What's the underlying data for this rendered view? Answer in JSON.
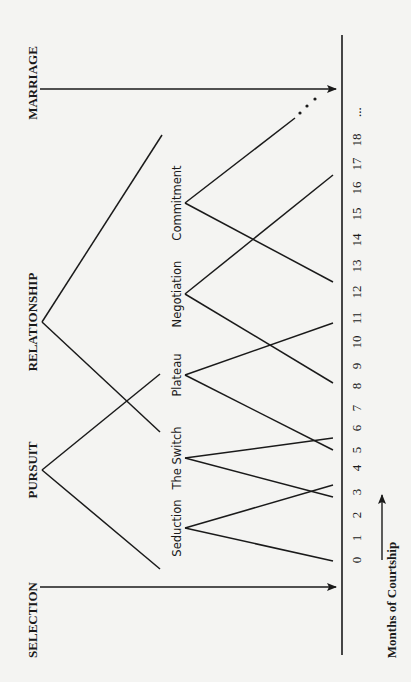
{
  "diagram": {
    "orientation": "rotated-90-ccw",
    "colors": {
      "background": "#f4f4f2",
      "ink": "#1a1a1a"
    },
    "axis": {
      "label": "Months of Courtship",
      "x": 342,
      "y_top": 35,
      "y_bottom": 655,
      "ticks": [
        "0",
        "1",
        "2",
        "3",
        "4",
        "5",
        "6",
        "7",
        "8",
        "9",
        "10",
        "11",
        "12",
        "13",
        "14",
        "15",
        "16",
        "17",
        "18",
        "..."
      ],
      "tick_y": [
        560,
        538,
        515,
        492,
        468,
        450,
        428,
        408,
        386,
        366,
        342,
        318,
        292,
        266,
        240,
        214,
        188,
        164,
        140,
        112
      ],
      "tick_label_x": 358,
      "arrow": {
        "x": 382,
        "y_from": 560,
        "y_to": 495
      },
      "label_x": 393,
      "label_y": 600
    },
    "phases": [
      {
        "id": "selection",
        "label": "SELECTION",
        "label_x": 34,
        "label_y": 620,
        "arrow": {
          "y": 587,
          "x_from": 40,
          "x_to": 336
        }
      },
      {
        "id": "pursuit",
        "label": "PURSUIT",
        "label_x": 34,
        "label_y": 470,
        "apex": [
          42,
          470
        ],
        "ends": [
          [
            160,
            569
          ],
          [
            160,
            374
          ]
        ]
      },
      {
        "id": "relationship",
        "label": "RELATIONSHIP",
        "label_x": 34,
        "label_y": 322,
        "apex": [
          42,
          322
        ],
        "ends": [
          [
            160,
            432
          ],
          [
            162,
            135
          ]
        ]
      },
      {
        "id": "marriage",
        "label": "MARRIAGE",
        "label_x": 34,
        "label_y": 83,
        "arrow": {
          "y": 89,
          "x_from": 40,
          "x_to": 336
        }
      }
    ],
    "stages": [
      {
        "id": "seduction",
        "label": "Seduction",
        "label_x": 177,
        "label_y": 528,
        "apex": [
          185,
          528
        ],
        "ends": [
          [
            333,
            561
          ],
          [
            333,
            485
          ]
        ]
      },
      {
        "id": "the-switch",
        "label": "The Switch",
        "label_x": 177,
        "label_y": 458,
        "apex": [
          185,
          458
        ],
        "ends": [
          [
            333,
            497
          ],
          [
            333,
            438
          ]
        ]
      },
      {
        "id": "plateau",
        "label": "Plateau",
        "label_x": 177,
        "label_y": 375,
        "apex": [
          185,
          375
        ],
        "ends": [
          [
            333,
            450
          ],
          [
            333,
            323
          ]
        ]
      },
      {
        "id": "negotiation",
        "label": "Negotiation",
        "label_x": 177,
        "label_y": 294,
        "apex": [
          185,
          294
        ],
        "ends": [
          [
            333,
            383
          ],
          [
            333,
            175
          ]
        ]
      },
      {
        "id": "commitment",
        "label": "Commitment",
        "label_x": 177,
        "label_y": 203,
        "apex": [
          185,
          203
        ],
        "ends": [
          [
            333,
            282
          ],
          [
            295,
            118
          ]
        ]
      }
    ],
    "continuation_dots": [
      [
        300,
        113
      ],
      [
        307,
        106
      ],
      [
        315,
        99
      ]
    ]
  }
}
